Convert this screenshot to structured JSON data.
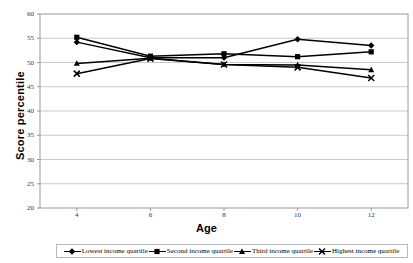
{
  "chart_data": {
    "type": "line",
    "title": "",
    "xlabel": "Age",
    "ylabel": "Score percentile",
    "x": [
      4,
      6,
      8,
      10,
      12
    ],
    "xtick_labels": [
      "4",
      "6",
      "8",
      "10",
      "12"
    ],
    "xlim": [
      3,
      13
    ],
    "ylim": [
      20,
      60
    ],
    "ytick_labels": [
      "20",
      "25",
      "30",
      "35",
      "40",
      "45",
      "50",
      "55",
      "60"
    ],
    "ytick_values": [
      20,
      25,
      30,
      35,
      40,
      45,
      50,
      55,
      60
    ],
    "grid": "horizontal",
    "legend_position": "bottom",
    "series": [
      {
        "name": "Lowest income quartile",
        "marker": "diamond",
        "color": "#000000",
        "values": [
          54.2,
          51.0,
          51.0,
          54.8,
          53.5
        ]
      },
      {
        "name": "Second income quartile",
        "marker": "square",
        "color": "#000000",
        "values": [
          55.2,
          51.3,
          51.8,
          51.2,
          52.2
        ]
      },
      {
        "name": "Third income quartile",
        "marker": "triangle",
        "color": "#000000",
        "values": [
          49.8,
          50.9,
          49.6,
          49.5,
          48.5
        ]
      },
      {
        "name": "Highest income quartile",
        "marker": "x",
        "color": "#000000",
        "values": [
          47.7,
          50.8,
          49.6,
          49.0,
          46.8
        ]
      }
    ]
  },
  "plot": {
    "border_color": "#9a9a9a",
    "grid_color": "#c9c9c9",
    "background": "#ffffff"
  }
}
